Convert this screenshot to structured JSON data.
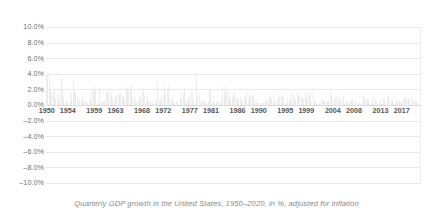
{
  "caption": "Quarterly GDP growth in the United States, 1950–2020, in %, adjusted for inflation",
  "colors": {
    "background": "#ffffff",
    "bar": "#ececec",
    "gridline": "#e8e8e8",
    "zero_line": "#dcdcdc",
    "y_label": "#6e6e6e",
    "x_label": "#555555",
    "caption": "#8a8a8a"
  },
  "chart_data": {
    "type": "bar",
    "title": "",
    "subtitle": "",
    "caption": "Quarterly GDP growth in the United States, 1950–2020, in %, adjusted for inflation",
    "xlabel": "",
    "ylabel": "",
    "ylim": [
      -10.0,
      10.0
    ],
    "ytick_labels": [
      "10.0%",
      "8.0%",
      "6.0%",
      "4.0%",
      "2.0%",
      "0.0%",
      "–2.0%",
      "–4.0%",
      "–6.0%",
      "–8.0%",
      "–10.0%"
    ],
    "ytick_values": [
      10.0,
      8.0,
      6.0,
      4.0,
      2.0,
      0.0,
      -2.0,
      -4.0,
      -6.0,
      -8.0,
      -10.0
    ],
    "xtick_labels": [
      "1950",
      "1954",
      "1959",
      "1963",
      "1968",
      "1972",
      "1977",
      "1981",
      "1986",
      "1990",
      "1995",
      "1999",
      "2004",
      "2008",
      "2013",
      "2017"
    ],
    "xtick_values": [
      1950,
      1954,
      1959,
      1963,
      1968,
      1972,
      1977,
      1981,
      1986,
      1990,
      1995,
      1999,
      2004,
      2008,
      2013,
      2017
    ],
    "xlim": [
      1949.75,
      1970.0
    ],
    "grid": true,
    "legend": false,
    "units": "percent",
    "frequency": "quarterly",
    "x": [
      1950.0,
      1950.25,
      1950.5,
      1950.75,
      1951.0,
      1951.25,
      1951.5,
      1951.75,
      1952.0,
      1952.25,
      1952.5,
      1952.75,
      1953.0,
      1953.25,
      1953.5,
      1953.75,
      1954.0,
      1954.25,
      1954.5,
      1954.75,
      1955.0,
      1955.25,
      1955.5,
      1955.75,
      1956.0,
      1956.25,
      1956.5,
      1956.75,
      1957.0,
      1957.25,
      1957.5,
      1957.75,
      1958.0,
      1958.25,
      1958.5,
      1958.75,
      1959.0,
      1959.25,
      1959.5,
      1959.75,
      1960.0,
      1960.25,
      1960.5,
      1960.75,
      1961.0,
      1961.25,
      1961.5,
      1961.75,
      1962.0,
      1962.25,
      1962.5,
      1962.75,
      1963.0,
      1963.25,
      1963.5,
      1963.75,
      1964.0,
      1964.25,
      1964.5,
      1964.75,
      1965.0,
      1965.25,
      1965.5,
      1965.75,
      1966.0,
      1966.25,
      1966.5,
      1966.75,
      1967.0,
      1967.25,
      1967.5,
      1967.75,
      1968.0,
      1968.25,
      1968.5,
      1968.75,
      1969.0,
      1969.25,
      1969.5,
      1969.75,
      1970.0,
      1970.25,
      1970.5,
      1970.75,
      1971.0,
      1971.25,
      1971.5,
      1971.75,
      1972.0,
      1972.25,
      1972.5,
      1972.75,
      1973.0,
      1973.25,
      1973.5,
      1973.75,
      1974.0,
      1974.25,
      1974.5,
      1974.75,
      1975.0,
      1975.25,
      1975.5,
      1975.75,
      1976.0,
      1976.25,
      1976.5,
      1976.75,
      1977.0,
      1977.25,
      1977.5,
      1977.75,
      1978.0,
      1978.25,
      1978.5,
      1978.75,
      1979.0,
      1979.25,
      1979.5,
      1979.75,
      1980.0,
      1980.25,
      1980.5,
      1980.75,
      1981.0,
      1981.25,
      1981.5,
      1981.75,
      1982.0,
      1982.25,
      1982.5,
      1982.75,
      1983.0,
      1983.25,
      1983.5,
      1983.75,
      1984.0,
      1984.25,
      1984.5,
      1984.75,
      1985.0,
      1985.25,
      1985.5,
      1985.75,
      1986.0,
      1986.25,
      1986.5,
      1986.75,
      1987.0,
      1987.25,
      1987.5,
      1987.75,
      1988.0,
      1988.25,
      1988.5,
      1988.75,
      1989.0,
      1989.25,
      1989.5,
      1989.75,
      1990.0,
      1990.25,
      1990.5,
      1990.75,
      1991.0,
      1991.25,
      1991.5,
      1991.75,
      1992.0,
      1992.25,
      1992.5,
      1992.75,
      1993.0,
      1993.25,
      1993.5,
      1993.75,
      1994.0,
      1994.25,
      1994.5,
      1994.75,
      1995.0,
      1995.25,
      1995.5,
      1995.75,
      1996.0,
      1996.25,
      1996.5,
      1996.75,
      1997.0,
      1997.25,
      1997.5,
      1997.75,
      1998.0,
      1998.25,
      1998.5,
      1998.75,
      1999.0,
      1999.25,
      1999.5,
      1999.75,
      2000.0,
      2000.25,
      2000.5,
      2000.75,
      2001.0,
      2001.25,
      2001.5,
      2001.75,
      2002.0,
      2002.25,
      2002.5,
      2002.75,
      2003.0,
      2003.25,
      2003.5,
      2003.75,
      2004.0,
      2004.25,
      2004.5,
      2004.75,
      2005.0,
      2005.25,
      2005.5,
      2005.75,
      2006.0,
      2006.25,
      2006.5,
      2006.75,
      2007.0,
      2007.25,
      2007.5,
      2007.75,
      2008.0,
      2008.25,
      2008.5,
      2008.75,
      2009.0,
      2009.25,
      2009.5,
      2009.75,
      2010.0,
      2010.25,
      2010.5,
      2010.75,
      2011.0,
      2011.25,
      2011.5,
      2011.75,
      2012.0,
      2012.25,
      2012.5,
      2012.75,
      2013.0,
      2013.25,
      2013.5,
      2013.75,
      2014.0,
      2014.25,
      2014.5,
      2014.75,
      2015.0,
      2015.25,
      2015.5,
      2015.75,
      2016.0,
      2016.25,
      2016.5,
      2016.75,
      2017.0,
      2017.25,
      2017.5,
      2017.75,
      2018.0,
      2018.25,
      2018.5,
      2018.75,
      2019.0,
      2019.25,
      2019.5,
      2019.75,
      2020.0,
      2020.25,
      2020.5
    ],
    "values": [
      3.9,
      4.0,
      4.1,
      2.0,
      1.5,
      1.6,
      2.0,
      0.8,
      0.9,
      0.5,
      1.5,
      3.4,
      2.0,
      1.0,
      0.3,
      0.4,
      0.4,
      0.2,
      0.6,
      1.6,
      3.0,
      1.8,
      1.6,
      1.2,
      0.2,
      0.8,
      0.5,
      0.9,
      0.6,
      0.5,
      0.3,
      0.4,
      0.5,
      0.6,
      2.0,
      2.4,
      2.1,
      2.2,
      0.4,
      0.3,
      2.1,
      0.3,
      0.5,
      0.4,
      0.6,
      1.8,
      1.7,
      1.6,
      2.1,
      1.3,
      0.9,
      0.6,
      1.0,
      1.4,
      1.3,
      1.5,
      1.6,
      1.2,
      1.1,
      0.7,
      2.3,
      1.9,
      2.0,
      2.3,
      2.5,
      0.8,
      1.0,
      0.6,
      0.5,
      0.7,
      0.9,
      1.2,
      1.5,
      2.0,
      1.1,
      0.7,
      1.0,
      0.5,
      0.6,
      0.3,
      0.4,
      0.3,
      0.8,
      0.2,
      2.8,
      0.6,
      0.8,
      1.0,
      1.3,
      2.4,
      1.1,
      1.9,
      2.5,
      1.0,
      0.6,
      1.0,
      0.4,
      0.3,
      0.5,
      0.4,
      0.3,
      0.8,
      1.6,
      1.3,
      2.2,
      0.7,
      0.6,
      0.8,
      1.1,
      1.7,
      1.6,
      0.5,
      0.3,
      4.0,
      1.2,
      1.3,
      0.2,
      0.5,
      0.7,
      0.3,
      0.3,
      0.2,
      0.5,
      1.9,
      2.1,
      0.4,
      1.2,
      0.3,
      0.3,
      0.5,
      0.4,
      0.3,
      0.8,
      2.3,
      2.0,
      1.7,
      2.4,
      1.7,
      1.0,
      0.9,
      1.0,
      1.6,
      1.5,
      0.8,
      0.9,
      0.8,
      1.0,
      0.5,
      0.6,
      1.0,
      1.1,
      1.7,
      0.5,
      1.3,
      1.0,
      1.3,
      1.1,
      0.7,
      0.6,
      0.2,
      0.3,
      0.2,
      0.3,
      0.2,
      0.2,
      0.5,
      0.7,
      0.5,
      1.2,
      1.0,
      0.9,
      1.3,
      0.2,
      0.6,
      0.5,
      1.4,
      1.0,
      1.4,
      1.1,
      1.0,
      0.3,
      0.2,
      0.9,
      0.8,
      0.7,
      1.7,
      0.9,
      1.1,
      0.7,
      1.6,
      1.4,
      1.0,
      0.9,
      1.0,
      0.8,
      1.4,
      0.8,
      1.6,
      1.2,
      1.7,
      0.2,
      1.9,
      0.1,
      0.6,
      0.3,
      0.2,
      0.3,
      0.3,
      0.8,
      0.6,
      0.5,
      0.2,
      0.5,
      0.7,
      1.8,
      1.1,
      0.6,
      0.8,
      0.9,
      1.0,
      1.0,
      0.6,
      0.9,
      0.7,
      1.3,
      0.3,
      0.2,
      0.7,
      0.1,
      0.6,
      0.5,
      0.6,
      0.3,
      0.5,
      0.2,
      0.2,
      0.2,
      0.1,
      0.4,
      1.1,
      0.9,
      0.9,
      0.7,
      0.6,
      0.2,
      0.8,
      0.1,
      1.1,
      0.8,
      0.4,
      0.1,
      0.1,
      0.7,
      0.1,
      0.8,
      0.9,
      0.3,
      1.2,
      1.2,
      0.5,
      0.8,
      0.6,
      0.3,
      0.1,
      0.5,
      0.5,
      0.6,
      0.2,
      0.5,
      0.7,
      0.8,
      0.9,
      0.6,
      0.9,
      0.7,
      0.3,
      0.8,
      0.5,
      0.6,
      0.5,
      0.2,
      0.1,
      7.5
    ]
  }
}
